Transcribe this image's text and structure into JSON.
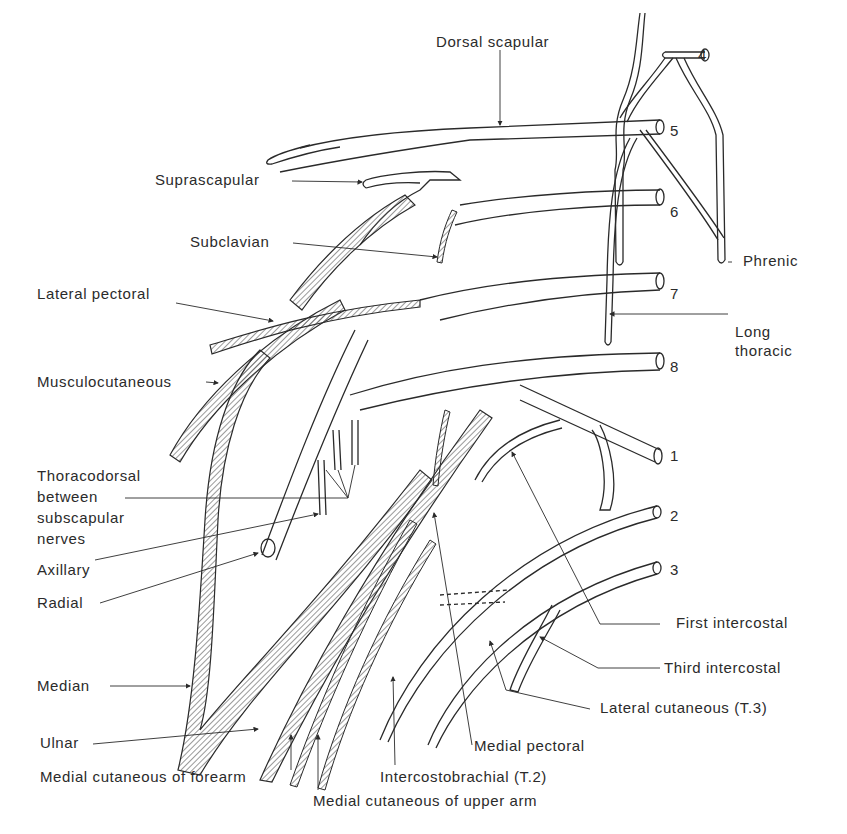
{
  "figure": {
    "root_numbers": [
      "4",
      "5",
      "6",
      "7",
      "8",
      "1",
      "2",
      "3"
    ],
    "colors": {
      "ink": "#2a2a2a",
      "background": "#ffffff",
      "hatch": "#555555"
    }
  },
  "labels": {
    "dorsal_scapular": "Dorsal scapular",
    "suprascapular": "Suprascapular",
    "subclavian": "Subclavian",
    "phrenic": "Phrenic",
    "lateral_pectoral": "Lateral pectoral",
    "long_thoracic_1": "Long",
    "long_thoracic_2": "thoracic",
    "musculocutaneous": "Musculocutaneous",
    "thoracodorsal_1": "Thoracodorsal",
    "thoracodorsal_2": "between",
    "thoracodorsal_3": "subscapular",
    "thoracodorsal_4": "nerves",
    "axillary": "Axillary",
    "radial": "Radial",
    "first_intercostal": "First intercostal",
    "third_intercostal": "Third intercostal",
    "median": "Median",
    "lateral_cutaneous": "Lateral cutaneous (T.3)",
    "ulnar": "Ulnar",
    "medial_pectoral": "Medial pectoral",
    "medial_cutaneous_forearm": "Medial cutaneous of forearm",
    "intercostobrachial": "Intercostobrachial (T.2)",
    "medial_cutaneous_upper_arm": "Medial cutaneous of upper arm"
  },
  "roots": {
    "c4": "4",
    "c5": "5",
    "c6": "6",
    "c7": "7",
    "c8": "8",
    "t1": "1",
    "t2": "2",
    "t3": "3"
  }
}
